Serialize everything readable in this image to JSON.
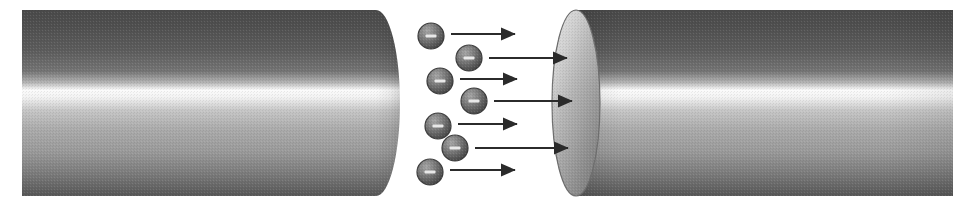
{
  "figure": {
    "title": "Electron beam travelling from one cylindrical electrode to another",
    "type": "diagram",
    "background_color": "#ffffff",
    "width": 975,
    "height": 206
  },
  "objects": {
    "left_cylinder": {
      "name": "left cylinder",
      "x": 22,
      "y": 10,
      "width": 378,
      "height": 186,
      "end_shape": "convex-right-ellipse",
      "cap_rx": 24,
      "colors": {
        "top_dark": "#4d4d4d",
        "upper_mid": "#6b6b6b",
        "highlight": "#fbfbfb",
        "lower_mid": "#a0a0a0",
        "bottom_dark": "#5a5a5a"
      },
      "highlight_position_pct": 43
    },
    "right_cylinder": {
      "name": "right cylinder",
      "x": 552,
      "y": 10,
      "width": 401,
      "height": 186,
      "end_shape": "elliptical-cap-left",
      "cap_rx": 24,
      "cap_colors": {
        "light": "#d3d3d3",
        "mid": "#a8a8a8",
        "dark": "#8a8a8a",
        "edge": "#6e6e6e"
      },
      "colors": {
        "top_dark": "#4d4d4d",
        "upper_mid": "#6b6b6b",
        "highlight": "#fbfbfb",
        "lower_mid": "#a0a0a0",
        "bottom_dark": "#5a5a5a"
      },
      "highlight_position_pct": 43
    },
    "gap": {
      "name": "vacuum gap",
      "x": 400,
      "width": 152
    }
  },
  "electrons": [
    {
      "label": "-",
      "cx": 431,
      "cy": 36,
      "r": 13,
      "arrow_x1": 451,
      "arrow_x2": 515,
      "arrow_y": 34
    },
    {
      "label": "-",
      "cx": 469,
      "cy": 58,
      "r": 13,
      "arrow_x1": 489,
      "arrow_x2": 567,
      "arrow_y": 58
    },
    {
      "label": "-",
      "cx": 440,
      "cy": 81,
      "r": 13,
      "arrow_x1": 460,
      "arrow_x2": 517,
      "arrow_y": 79
    },
    {
      "label": "-",
      "cx": 474,
      "cy": 101,
      "r": 13,
      "arrow_x1": 494,
      "arrow_x2": 572,
      "arrow_y": 101
    },
    {
      "label": "-",
      "cx": 438,
      "cy": 126,
      "r": 13,
      "arrow_x1": 458,
      "arrow_x2": 517,
      "arrow_y": 124
    },
    {
      "label": "-",
      "cx": 455,
      "cy": 148,
      "r": 13,
      "arrow_x1": 475,
      "arrow_x2": 568,
      "arrow_y": 148
    },
    {
      "label": "-",
      "cx": 430,
      "cy": 172,
      "r": 13,
      "arrow_x1": 450,
      "arrow_x2": 515,
      "arrow_y": 170
    }
  ],
  "electron_style": {
    "fill_light": "#9a9a9a",
    "fill_mid": "#6f6f6f",
    "fill_dark": "#4a4a4a",
    "stroke": "#3c3c3c",
    "sign_color": "#e8e8e8",
    "sign_width": 11,
    "sign_height": 3
  },
  "arrow_style": {
    "color": "#2b2b2b",
    "line_width": 2,
    "head_length": 11,
    "head_width": 11
  }
}
